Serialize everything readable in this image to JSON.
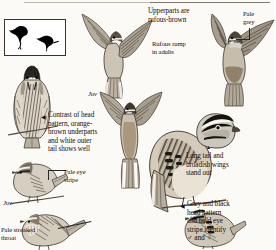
{
  "plate": {
    "kind": "field-guide-identification-plate",
    "subject": "sparrow-like passerine",
    "background_color": "#fbfaf7",
    "ink_color": "#14120f"
  },
  "silhouette_box": {
    "name": "flight-and-perched-silhouettes",
    "count": 2,
    "fill": "#000000",
    "border_color": "#3a342c"
  },
  "captions": {
    "upperparts": "Upperparts are\nrufous-brown",
    "pale_grey": "Pale\ngrey",
    "rufous_rump": "Rufous rump\nin adults",
    "contrast_head": "Contrast of head\npattern, orange-\nbrown underparts\nand white outer\ntail shows well",
    "long_tail": "Long tail and\nbroadish wings\nstand out",
    "grey_black_head": "Grey and black\nhead pattern\nand bold eye\nstripe identify",
    "grey_black_head_sexes": "♂ and ♀",
    "pale_eye_stripe": "Pale eye\nstripe",
    "pale_streaked_throat": "Pale streaked\nthroat"
  },
  "age_labels": {
    "juv_upper": "Juv",
    "juv_lower": "Juv"
  },
  "markers": {
    "left_arrow": "◀",
    "up_arrow": "▲"
  }
}
